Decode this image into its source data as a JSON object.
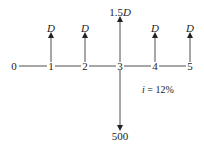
{
  "diagram": {
    "type": "cash-flow-diagram",
    "periods": [
      "0",
      "1",
      "2",
      "3",
      "4",
      "5"
    ],
    "inflows": [
      {
        "period": "1",
        "label": "D"
      },
      {
        "period": "2",
        "label": "D"
      },
      {
        "period": "3",
        "label": "1.5D"
      },
      {
        "period": "4",
        "label": "D"
      },
      {
        "period": "5",
        "label": "D"
      }
    ],
    "outflows": [
      {
        "period": "3",
        "label": "500"
      }
    ],
    "interest": {
      "symbol": "i",
      "equals": "=",
      "value": "12%"
    },
    "colors": {
      "line": "#222222",
      "background": "#ffffff"
    }
  }
}
